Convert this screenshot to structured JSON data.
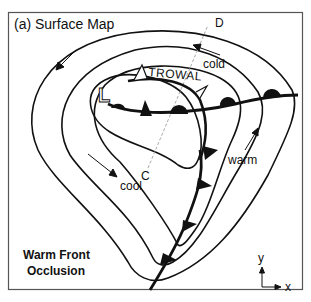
{
  "panel": {
    "title": "(a) Surface Map",
    "caption_line1": "Warm Front",
    "caption_line2": "Occlusion"
  },
  "labels": {
    "low": "L",
    "trowal": "TROWAL",
    "cold": "cold",
    "warm": "warm",
    "cool": "cool",
    "section_start": "C",
    "section_end": "D"
  },
  "axes": {
    "y": "y",
    "x": "x"
  },
  "colors": {
    "ink": "#111111",
    "frame": "#555555",
    "section_line": "#aaaaaa",
    "background": "#ffffff"
  }
}
